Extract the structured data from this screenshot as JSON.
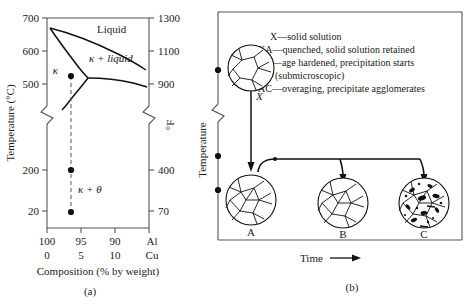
{
  "figure": {
    "panel_a": {
      "caption": "(a)",
      "left_axis": {
        "title": "Temperature (°C)",
        "ticks": [
          "700",
          "600",
          "500",
          "200",
          "20"
        ],
        "has_break": true
      },
      "right_axis": {
        "title": "°F",
        "ticks": [
          "1300",
          "1100",
          "900",
          "400",
          "70"
        ],
        "has_break": true
      },
      "x_axis": {
        "title": "Composition (% by weight)",
        "row1": [
          "100",
          "95",
          "90",
          "Al"
        ],
        "row2": [
          "0",
          "5",
          "10",
          "Cu"
        ]
      },
      "region_labels": {
        "liquid": "Liquid",
        "kappa_plus_liquid": "κ + liquid",
        "kappa": "κ",
        "kappa_plus_theta": "κ + θ"
      },
      "points": [
        {
          "label": "κ-point",
          "composition": "95",
          "temperature_c": "548"
        },
        {
          "label": "mid-point",
          "composition": "95",
          "temperature_c": "200"
        },
        {
          "label": "room-point",
          "composition": "95",
          "temperature_c": "20"
        }
      ]
    },
    "panel_b": {
      "caption": "(b)",
      "y_axis_title": "Temperature",
      "x_axis_title": "Time",
      "legend": [
        "X—solid solution",
        "XA—quenched, solid solution retained",
        "AB—age hardened, precipitation starts",
        "(submicroscopic)",
        "AC—overaging, precipitate agglomerates"
      ],
      "path_label": "X",
      "micrographs": [
        {
          "label": "A"
        },
        {
          "label": "B"
        },
        {
          "label": "C"
        }
      ]
    }
  },
  "colors": {
    "ink": "#1a1a1a",
    "axis": "#555555",
    "grain_fill": "#fdfdfd",
    "precipitate": "#111111"
  }
}
